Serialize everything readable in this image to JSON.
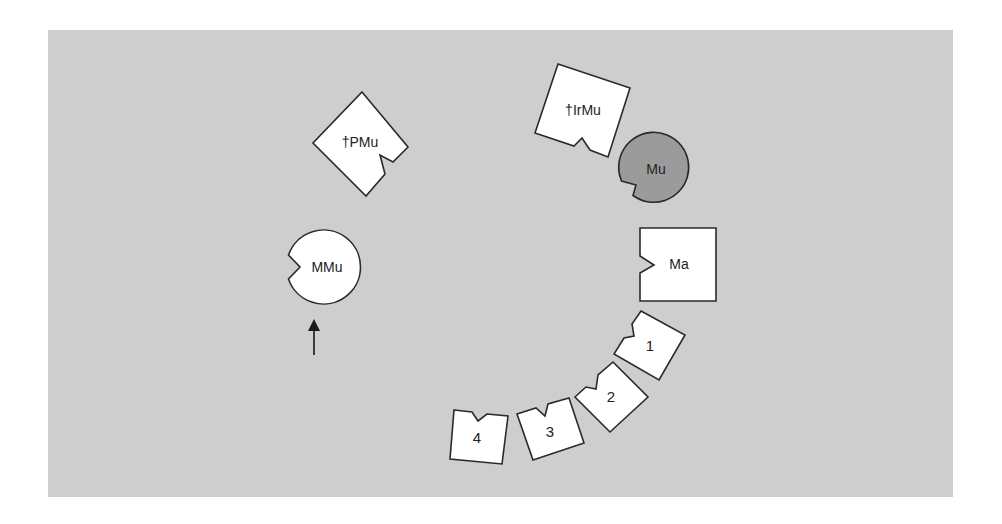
{
  "diagram": {
    "background_color": "#cecece",
    "shape_fill": "#ffffff",
    "highlight_fill": "#9b9b9b",
    "stroke_color": "#2a2a2a",
    "nodes": [
      {
        "id": "pmu",
        "label": "†PMu",
        "shape": "notched-square",
        "fill": "#ffffff"
      },
      {
        "id": "irmu",
        "label": "†IrMu",
        "shape": "notched-square",
        "fill": "#ffffff"
      },
      {
        "id": "mu",
        "label": "Mu",
        "shape": "notched-circle",
        "fill": "#9b9b9b"
      },
      {
        "id": "mmu",
        "label": "MMu",
        "shape": "notched-circle",
        "fill": "#ffffff"
      },
      {
        "id": "ma",
        "label": "Ma",
        "shape": "notched-square",
        "fill": "#ffffff"
      },
      {
        "id": "b1",
        "label": "1",
        "shape": "notched-square",
        "fill": "#ffffff"
      },
      {
        "id": "b2",
        "label": "2",
        "shape": "notched-square",
        "fill": "#ffffff"
      },
      {
        "id": "b3",
        "label": "3",
        "shape": "notched-square",
        "fill": "#ffffff"
      },
      {
        "id": "b4",
        "label": "4",
        "shape": "notched-square",
        "fill": "#ffffff"
      }
    ],
    "arrow": {
      "direction": "up",
      "points_to": "MMu"
    }
  }
}
